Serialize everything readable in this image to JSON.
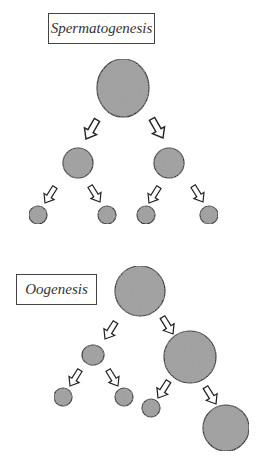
{
  "diagram": {
    "spermatogenesis": {
      "label": "Spermatogenesis",
      "cells": [
        {
          "id": "primary",
          "cx": 123,
          "cy": 88,
          "r": 26
        },
        {
          "id": "secondary-left",
          "cx": 78,
          "cy": 163,
          "r": 15
        },
        {
          "id": "secondary-right",
          "cx": 169,
          "cy": 163,
          "r": 15
        },
        {
          "id": "spermatid-1",
          "cx": 38,
          "cy": 215,
          "r": 9
        },
        {
          "id": "spermatid-2",
          "cx": 107,
          "cy": 215,
          "r": 9
        },
        {
          "id": "spermatid-3",
          "cx": 146,
          "cy": 215,
          "r": 9
        },
        {
          "id": "spermatid-4",
          "cx": 209,
          "cy": 215,
          "r": 9
        }
      ]
    },
    "oogenesis": {
      "label": "Oogenesis",
      "cells": [
        {
          "id": "primary-oocyte",
          "cx": 140,
          "cy": 291,
          "r": 25
        },
        {
          "id": "polar-body-1",
          "cx": 93,
          "cy": 355,
          "r": 11
        },
        {
          "id": "secondary-oocyte",
          "cx": 190,
          "cy": 358,
          "r": 25
        },
        {
          "id": "polar-body-2a",
          "cx": 63,
          "cy": 397,
          "r": 9
        },
        {
          "id": "polar-body-2b",
          "cx": 124,
          "cy": 397,
          "r": 9
        },
        {
          "id": "polar-body-2c",
          "cx": 151,
          "cy": 409,
          "r": 9
        },
        {
          "id": "ovum",
          "cx": 226,
          "cy": 428,
          "r": 23
        }
      ]
    },
    "colors": {
      "cell_fill": "#9a9a9a",
      "cell_stroke": "#333333",
      "arrow_stroke": "#222222",
      "arrow_fill": "#ffffff"
    }
  }
}
